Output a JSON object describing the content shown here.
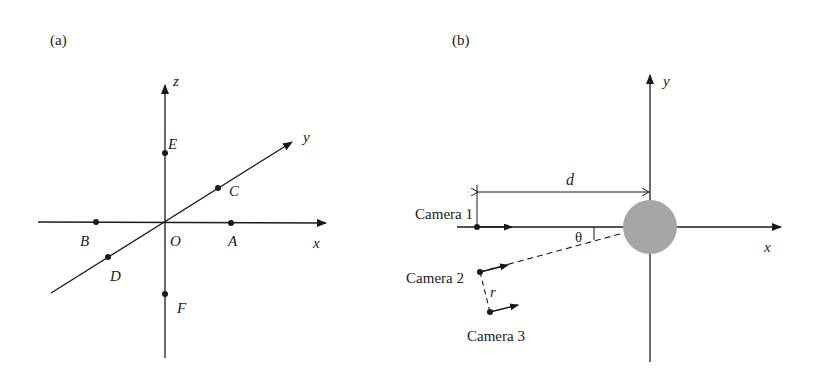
{
  "panels": [
    {
      "label": "(a)",
      "axes": {
        "x": "x",
        "y": "y",
        "z": "z"
      },
      "origin_label": "O",
      "points": [
        "A",
        "B",
        "C",
        "D",
        "E",
        "F"
      ]
    },
    {
      "label": "(b)",
      "axes": {
        "x": "x",
        "y": "y"
      },
      "cameras": [
        "Camera 1",
        "Camera 2",
        "Camera 3"
      ],
      "distance_label": "d",
      "angle_label": "θ",
      "offset_label": "r",
      "target_color": "#a6a6a6"
    }
  ],
  "colors": {
    "line": "#1a1a1a",
    "target": "#a6a6a6",
    "background": "#ffffff"
  }
}
